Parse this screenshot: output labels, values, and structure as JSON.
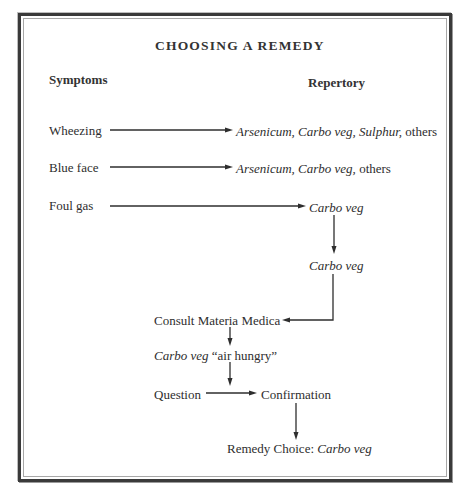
{
  "title": "CHOOSING A REMEDY",
  "headers": {
    "symptoms": "Symptoms",
    "repertory": "Repertory"
  },
  "rows": [
    {
      "symptom": "Wheezing",
      "remedies_italic": "Arsenicum, Carbo veg, Sulphur,",
      "remedies_suffix": " others"
    },
    {
      "symptom": "Blue face",
      "remedies_italic": "Arsenicum, Carbo veg,",
      "remedies_suffix": " others"
    },
    {
      "symptom": "Foul gas",
      "remedies_italic": "Carbo veg",
      "remedies_suffix": ""
    }
  ],
  "flow": {
    "intersection": "Carbo veg",
    "consult": "Consult Materia Medica",
    "materia_italic": "Carbo veg",
    "materia_note": " “air hungry”",
    "question": "Question",
    "confirmation": "Confirmation",
    "choice_prefix": "Remedy Choice: ",
    "choice_italic": "Carbo veg"
  },
  "colors": {
    "ink": "#2e2e2e",
    "frame": "#3a3a3a",
    "frame_inner": "#a8a8a8",
    "background": "#ffffff"
  }
}
